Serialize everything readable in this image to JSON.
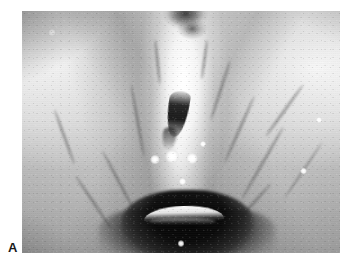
{
  "figure": {
    "panel_label": "A",
    "caption_text": "",
    "background_color": "#ffffff"
  },
  "image": {
    "name": "laryngoscopy-photograph",
    "modality": "endoscopic photograph",
    "color_mode": "grayscale",
    "frame": {
      "x": 22,
      "y": 11,
      "width": 318,
      "height": 242
    },
    "palette": {
      "background": "#ffffff",
      "mid_tissue": "#9e9e9e",
      "bright_tissue": "#f2f2f2",
      "dark_airway": "#0e0e0e",
      "specular": "#ffffff",
      "vessel": "#484848"
    },
    "regions": [
      {
        "name": "left-supraglottic-fold",
        "tone": "bright",
        "cx_pct": 22,
        "cy_pct": 30
      },
      {
        "name": "right-supraglottic-fold",
        "tone": "bright",
        "cx_pct": 80,
        "cy_pct": 31
      },
      {
        "name": "midline-glottic-column",
        "tone": "very-bright",
        "cx_pct": 50,
        "cy_pct": 36
      },
      {
        "name": "petiole-anterior-commissure",
        "tone": "dark",
        "cx_pct": 51,
        "cy_pct": 15
      },
      {
        "name": "glottic-chink-slit",
        "tone": "very-dark",
        "cx_pct": 49,
        "cy_pct": 42
      },
      {
        "name": "subglottic-airway-cavity",
        "tone": "very-dark",
        "cx_pct": 52,
        "cy_pct": 88
      },
      {
        "name": "airway-light-reflex-arc",
        "tone": "very-bright",
        "cx_pct": 51,
        "cy_pct": 83
      }
    ],
    "specular_highlights": [
      {
        "x_pct": 41.8,
        "y_pct": 61.5,
        "r_pct": 1.5
      },
      {
        "x_pct": 47.2,
        "y_pct": 60.2,
        "r_pct": 2.1
      },
      {
        "x_pct": 53.5,
        "y_pct": 61.0,
        "r_pct": 1.8
      },
      {
        "x_pct": 57.0,
        "y_pct": 55.0,
        "r_pct": 1.0
      },
      {
        "x_pct": 50.5,
        "y_pct": 70.5,
        "r_pct": 1.2
      },
      {
        "x_pct": 50.0,
        "y_pct": 96.0,
        "r_pct": 1.1
      },
      {
        "x_pct": 9.5,
        "y_pct": 9.0,
        "r_pct": 1.2
      },
      {
        "x_pct": 88.5,
        "y_pct": 66.0,
        "r_pct": 1.0
      },
      {
        "x_pct": 93.5,
        "y_pct": 45.0,
        "r_pct": 0.9
      }
    ],
    "vessels": [
      {
        "x_pct": 62,
        "y_pct": 20,
        "w_pct": 1.1,
        "h_pct": 26,
        "rot": 18
      },
      {
        "x_pct": 68,
        "y_pct": 34,
        "w_pct": 0.9,
        "h_pct": 30,
        "rot": 24
      },
      {
        "x_pct": 75,
        "y_pct": 46,
        "w_pct": 0.8,
        "h_pct": 34,
        "rot": 30
      },
      {
        "x_pct": 82,
        "y_pct": 28,
        "w_pct": 0.8,
        "h_pct": 26,
        "rot": 36
      },
      {
        "x_pct": 88,
        "y_pct": 52,
        "w_pct": 0.7,
        "h_pct": 28,
        "rot": 34
      },
      {
        "x_pct": 71,
        "y_pct": 68,
        "w_pct": 0.8,
        "h_pct": 26,
        "rot": 42
      },
      {
        "x_pct": 30,
        "y_pct": 56,
        "w_pct": 0.9,
        "h_pct": 28,
        "rot": -28
      },
      {
        "x_pct": 22,
        "y_pct": 66,
        "w_pct": 0.8,
        "h_pct": 26,
        "rot": -34
      },
      {
        "x_pct": 13,
        "y_pct": 40,
        "w_pct": 0.9,
        "h_pct": 24,
        "rot": -20
      },
      {
        "x_pct": 36,
        "y_pct": 30,
        "w_pct": 0.9,
        "h_pct": 30,
        "rot": -10
      },
      {
        "x_pct": 42,
        "y_pct": 12,
        "w_pct": 0.8,
        "h_pct": 18,
        "rot": -6
      },
      {
        "x_pct": 57,
        "y_pct": 12,
        "w_pct": 0.8,
        "h_pct": 16,
        "rot": 8
      }
    ]
  }
}
